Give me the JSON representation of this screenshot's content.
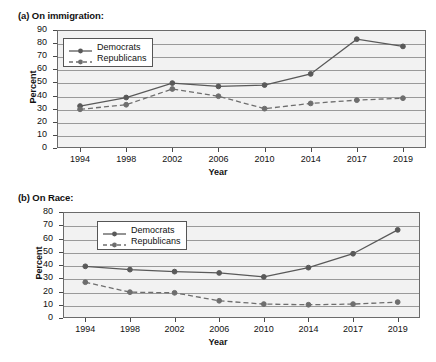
{
  "figure": {
    "panel_a_title": "(a) On immigration:",
    "panel_b_title": "(b) On Race:",
    "line_color_democrats": "#595959",
    "line_color_republicans": "#6e6e6e",
    "plot_background": "#f2f2f2",
    "grid_color": "#9a9a9a"
  },
  "chart_data": [
    {
      "type": "line",
      "title": "(a) On immigration:",
      "xlabel": "Year",
      "ylabel": "Percent",
      "categories": [
        "1994",
        "1998",
        "2002",
        "2006",
        "2010",
        "2014",
        "2017",
        "2019"
      ],
      "ylim": [
        0,
        90
      ],
      "ytick_step": 10,
      "yticks": [
        "0",
        "10",
        "20",
        "30",
        "40",
        "50",
        "60",
        "70",
        "80",
        "90"
      ],
      "grid": true,
      "legend_position": "upper-left-inside",
      "series": [
        {
          "name": "Democrats",
          "style": "solid",
          "values": [
            32,
            38.5,
            49.5,
            47,
            48,
            56.5,
            83,
            77.5
          ]
        },
        {
          "name": "Republicans",
          "style": "dashed",
          "values": [
            29.5,
            33,
            45,
            39.5,
            30,
            34,
            36.5,
            38
          ]
        }
      ]
    },
    {
      "type": "line",
      "title": "(b) On Race:",
      "xlabel": "Year",
      "ylabel": "Percent",
      "categories": [
        "1994",
        "1998",
        "2002",
        "2006",
        "2010",
        "2014",
        "2017",
        "2019"
      ],
      "ylim": [
        0,
        80
      ],
      "ytick_step": 10,
      "yticks": [
        "0",
        "10",
        "20",
        "30",
        "40",
        "50",
        "60",
        "70",
        "80"
      ],
      "grid": true,
      "legend_position": "upper-left-inside",
      "series": [
        {
          "name": "Democrats",
          "style": "solid",
          "values": [
            39,
            36.5,
            35,
            34,
            31,
            38,
            48.5,
            66.5
          ]
        },
        {
          "name": "Republicans",
          "style": "dashed",
          "values": [
            27,
            19.5,
            19,
            13,
            10.5,
            10,
            10.5,
            12
          ]
        }
      ]
    }
  ]
}
